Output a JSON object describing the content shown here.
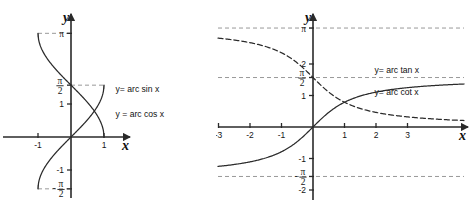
{
  "chart_data": [
    {
      "type": "line",
      "title": "",
      "id": "arcsin-arccos",
      "xlabel": "x",
      "ylabel": "y",
      "xlim": [
        -1.7,
        1.9
      ],
      "ylim": [
        -2.1,
        3.6
      ],
      "grid": false,
      "legend_position": "inline-right",
      "x_ticks": [
        {
          "value": -1,
          "label": "-1"
        },
        {
          "value": 1,
          "label": "1"
        }
      ],
      "y_ticks": [
        {
          "value": 3.1416,
          "label": "π",
          "type": "pi"
        },
        {
          "value": 1.5708,
          "label": "π/2",
          "type": "pi-half"
        },
        {
          "value": 1,
          "label": "1",
          "type": "num"
        },
        {
          "value": -1,
          "label": "-1",
          "type": "num"
        },
        {
          "value": -1.5708,
          "label": "-π/2",
          "type": "neg-pi-half"
        }
      ],
      "guides": [
        {
          "from": [
            -1,
            3.1416
          ],
          "to": [
            0,
            3.1416
          ],
          "orientation": "horizontal"
        },
        {
          "from": [
            -1,
            -1.5708
          ],
          "to": [
            0,
            -1.5708
          ],
          "orientation": "horizontal"
        },
        {
          "from": [
            0,
            1.5708
          ],
          "to": [
            1,
            1.5708
          ],
          "orientation": "horizontal"
        }
      ],
      "series": [
        {
          "name": "y= arc sin x",
          "label": "y= arc sin x",
          "style": "solid",
          "domain": [
            -1,
            1
          ],
          "range": [
            -1.5708,
            1.5708
          ],
          "fn": "arcsin",
          "label_at": [
            1.35,
            1.35
          ]
        },
        {
          "name": "y = arc cos x",
          "label": "y = arc cos x",
          "style": "solid",
          "domain": [
            -1,
            1
          ],
          "range": [
            0,
            3.1416
          ],
          "fn": "arccos",
          "label_at": [
            1.35,
            0.62
          ]
        }
      ]
    },
    {
      "type": "line",
      "title": "",
      "id": "arctan-arccot",
      "xlabel": "x",
      "ylabel": "y",
      "xlim": [
        -4.6,
        4.9
      ],
      "ylim": [
        -2.45,
        3.7
      ],
      "grid": false,
      "legend_position": "inline-right",
      "x_ticks": [
        {
          "value": -3,
          "label": "-3"
        },
        {
          "value": -2,
          "label": "-2"
        },
        {
          "value": -1,
          "label": "-1"
        },
        {
          "value": 1,
          "label": "1"
        },
        {
          "value": 2,
          "label": "2"
        },
        {
          "value": 3,
          "label": "3"
        }
      ],
      "y_ticks": [
        {
          "value": 3.1416,
          "label": "π",
          "type": "pi"
        },
        {
          "value": 2,
          "label": "2",
          "type": "num"
        },
        {
          "value": 1.5708,
          "label": "π/2",
          "type": "pi-half"
        },
        {
          "value": 1,
          "label": "1",
          "type": "num"
        },
        {
          "value": -1,
          "label": "-1",
          "type": "num"
        },
        {
          "value": -1.5708,
          "label": "-π/2",
          "type": "neg-pi-half"
        },
        {
          "value": -2,
          "label": "-2",
          "type": "num"
        }
      ],
      "guides": [
        {
          "value": 3.1416,
          "orientation": "horizontal",
          "note": "asymptote y=π"
        },
        {
          "value": 1.5708,
          "orientation": "horizontal",
          "note": "asymptote y=π/2"
        },
        {
          "value": -1.5708,
          "orientation": "horizontal",
          "note": "asymptote y=-π/2"
        }
      ],
      "series": [
        {
          "name": "y= arc tan x",
          "label": "y= arc tan x",
          "style": "solid",
          "fn": "arctan",
          "range": [
            -1.5708,
            1.5708
          ],
          "label_at": [
            1.95,
            1.72
          ]
        },
        {
          "name": "y= arc cot x",
          "label": "y= arc cot x",
          "style": "dashed",
          "fn": "arccot",
          "range": [
            0,
            3.1416
          ],
          "label_at": [
            1.95,
            1.02
          ]
        }
      ]
    }
  ],
  "figure": {
    "panels": [
      {
        "name": "left-panel",
        "caption": "arcsin / arccos graph"
      },
      {
        "name": "right-panel",
        "caption": "arctan / arccot graph"
      }
    ],
    "background": "#ffffff",
    "curve_color": "#2b2b2b",
    "axis_color": "#2a2a2a",
    "guide_color": "#8d8d8d"
  }
}
